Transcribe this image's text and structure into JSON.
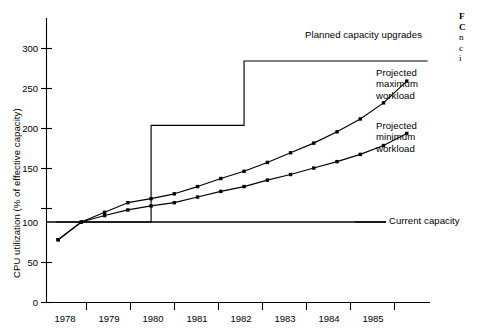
{
  "chart_data": {
    "type": "line",
    "title": "",
    "xlabel": "",
    "ylabel": "CPU utilization (% of effective capacity)",
    "xlim": [
      1977.75,
      1986.0
    ],
    "ylim": [
      0,
      330
    ],
    "yticks": [
      0,
      50,
      100,
      150,
      200,
      250,
      300
    ],
    "xticks": [
      1978,
      1979,
      1980,
      1981,
      1982,
      1983,
      1984,
      1985
    ],
    "xtick_labels": [
      "1978",
      "1979",
      "1980",
      "1981",
      "1982",
      "1983",
      "1984",
      "1985"
    ],
    "ytick_labels": [
      "0",
      "50",
      "100",
      "150",
      "200",
      "250",
      "300"
    ],
    "grid": false,
    "legend_position": "inline-annotations",
    "series": [
      {
        "name": "Projected maximum workload",
        "x": [
          1978.0,
          1978.5,
          1979.0,
          1979.5,
          1980.0,
          1980.5,
          1981.0,
          1981.5,
          1982.0,
          1982.5,
          1983.0,
          1983.5,
          1984.0,
          1984.5,
          1985.0,
          1985.5
        ],
        "values": [
          78,
          100,
          112,
          124,
          129,
          135,
          144,
          154,
          163,
          174,
          186,
          198,
          212,
          228,
          248,
          275
        ]
      },
      {
        "name": "Projected minimum workload",
        "x": [
          1978.0,
          1978.5,
          1979.0,
          1979.5,
          1980.0,
          1980.5,
          1981.0,
          1981.5,
          1982.0,
          1982.5,
          1983.0,
          1983.5,
          1984.0,
          1984.5,
          1985.0,
          1985.5
        ],
        "values": [
          78,
          100,
          108,
          115,
          120,
          124,
          131,
          138,
          144,
          152,
          159,
          167,
          175,
          184,
          195,
          210
        ]
      }
    ],
    "step_series": {
      "name": "Planned capacity upgrades",
      "x": [
        1977.95,
        1980.0,
        1980.0,
        1982.0,
        1982.0,
        1985.95
      ],
      "values": [
        100,
        100,
        220,
        220,
        300,
        300
      ],
      "levels": [
        100,
        220,
        300
      ],
      "upgrade_years": [
        1980,
        1982
      ]
    },
    "reference_line": {
      "name": "Current capacity",
      "value": 100
    },
    "annotations": [
      {
        "id": "planned",
        "text": "Planned capacity upgrades"
      },
      {
        "id": "max",
        "text": "Projected\nmaximum\nworkload"
      },
      {
        "id": "min",
        "text": "Projected\nminimum\nworkload"
      },
      {
        "id": "current",
        "text": "Current capacity"
      }
    ]
  },
  "annotations": {
    "planned_capacity_upgrades": "Planned capacity upgrades",
    "projected_maximum_line1": "Projected",
    "projected_maximum_line2": "maximum",
    "projected_maximum_line3": "workload",
    "projected_minimum_line1": "Projected",
    "projected_minimum_line2": "minimum",
    "projected_minimum_line3": "workload",
    "current_capacity": "Current capacity"
  },
  "axes": {
    "y_title": "CPU utilization (% of effective capacity)",
    "y_ticks": [
      "300",
      "250",
      "200",
      "150",
      "100",
      "50",
      "0"
    ],
    "x_ticks": [
      "1978",
      "1979",
      "1980",
      "1981",
      "1982",
      "1983",
      "1984",
      "1985"
    ]
  },
  "caption": {
    "line1": "F",
    "line2": "C",
    "line3": "n",
    "line4": "c",
    "line5": "i"
  }
}
